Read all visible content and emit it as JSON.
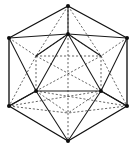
{
  "figure": {
    "kind": "polyhedron-wireframe",
    "alt_text": "Wireframe drawing of an icosahedron with hexagonal outline, solid visible edges and dashed hidden edges",
    "colors": {
      "background": "#ffffff",
      "visible_edge": "#1a1a1a",
      "outer_edge": "#111111",
      "hidden_edge": "#4a4a4a",
      "vertex": "#0d0d0d"
    },
    "canvas": {
      "width": 136,
      "height": 150
    },
    "style": {
      "visible_edge_style": "solid",
      "hidden_edge_style": "dashed",
      "dash_pattern": "2.1 1.9",
      "vertex_marker": "filled-dot"
    },
    "vertices": [
      {
        "id": "top-apex",
        "x": 68,
        "y": 6,
        "label": "A",
        "visible": true
      },
      {
        "id": "upper-left-outer",
        "x": 9,
        "y": 38,
        "label": "B",
        "visible": true
      },
      {
        "id": "upper-right-outer",
        "x": 127,
        "y": 38,
        "label": "C",
        "visible": true
      },
      {
        "id": "lower-left-outer",
        "x": 9,
        "y": 106,
        "label": "D",
        "visible": true
      },
      {
        "id": "lower-right-outer",
        "x": 127,
        "y": 106,
        "label": "E",
        "visible": true
      },
      {
        "id": "bottom-apex",
        "x": 68,
        "y": 141,
        "label": "F",
        "visible": true
      },
      {
        "id": "inner-top",
        "x": 68,
        "y": 34,
        "label": "G",
        "visible": true
      },
      {
        "id": "inner-left",
        "x": 36,
        "y": 91,
        "label": "H",
        "visible": true
      },
      {
        "id": "inner-right",
        "x": 101,
        "y": 91,
        "label": "I",
        "visible": true
      },
      {
        "id": "hidden-bottom",
        "x": 68,
        "y": 113,
        "label": "J",
        "visible": false
      },
      {
        "id": "hidden-left",
        "x": 36,
        "y": 56,
        "label": "K",
        "visible": false
      },
      {
        "id": "hidden-right",
        "x": 101,
        "y": 56,
        "label": "L",
        "visible": false
      }
    ],
    "edge_counts": {
      "visible": 18,
      "hidden": 12,
      "total": 30
    },
    "face_count": 20,
    "vertex_count": 12
  }
}
